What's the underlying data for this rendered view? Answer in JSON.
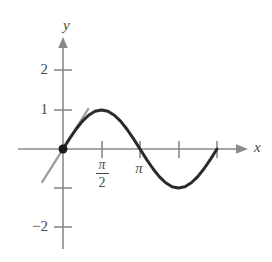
{
  "figure": {
    "background_color": "#ffffff"
  },
  "axes": {
    "x_label": "x",
    "y_label": "y",
    "axis_color": "#8a8a8a",
    "label_color": "#4a4a4a",
    "y_ticks": [
      {
        "value": 2,
        "label": "2"
      },
      {
        "value": 1,
        "label": "1"
      },
      {
        "value": -1,
        "label": ""
      },
      {
        "value": -2,
        "label": "−2"
      }
    ],
    "x_ticks": [
      {
        "value": 1.5708,
        "label_numerator": "π",
        "label_denominator": "2",
        "label": "π/2"
      },
      {
        "value": 3.1416,
        "label": "π"
      },
      {
        "value": 4.7124,
        "label": ""
      },
      {
        "value": 6.2832,
        "label": ""
      }
    ]
  },
  "chart_data": {
    "type": "line",
    "title": "",
    "xlabel": "x",
    "ylabel": "y",
    "xlim": [
      -0.9,
      7.0
    ],
    "ylim": [
      -2.6,
      2.6
    ],
    "grid": false,
    "legend": null,
    "series": [
      {
        "name": "y = sin x",
        "color": "#2a2a2a",
        "width": 3,
        "x": [
          0,
          0.2618,
          0.5236,
          0.7854,
          1.0472,
          1.309,
          1.5708,
          1.8326,
          2.0944,
          2.3562,
          2.618,
          2.8798,
          3.1416,
          3.4034,
          3.6652,
          3.927,
          4.1888,
          4.4506,
          4.7124,
          4.9742,
          5.236,
          5.4978,
          5.7596,
          6.0214,
          6.2832
        ],
        "y": [
          0,
          0.2588,
          0.5,
          0.7071,
          0.866,
          0.9659,
          1,
          0.9659,
          0.866,
          0.7071,
          0.5,
          0.2588,
          0,
          -0.2588,
          -0.5,
          -0.7071,
          -0.866,
          -0.9659,
          -1,
          -0.9659,
          -0.866,
          -0.7071,
          -0.5,
          -0.2588,
          0
        ]
      },
      {
        "name": "tangent line y = x",
        "color": "#9a9a9a",
        "width": 2,
        "x": [
          -0.85,
          1.03
        ],
        "y": [
          -0.85,
          1.03
        ]
      }
    ],
    "points": [
      {
        "name": "point-of-tangency",
        "x": 0,
        "y": 0,
        "color": "#1a1a1a",
        "radius": 4.5
      }
    ],
    "annotations": []
  }
}
